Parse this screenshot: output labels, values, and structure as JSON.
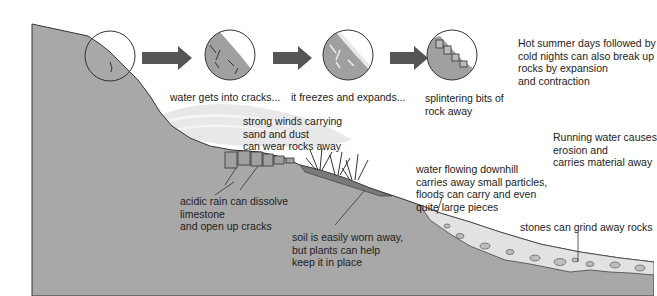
{
  "diagram": {
    "colors": {
      "rock": "#a9a9a9",
      "rock_dark": "#8a8a8a",
      "outline": "#333333",
      "arrow": "#555555",
      "wind": "#e6e6e6",
      "water": "#dcdcdc",
      "text": "#222222"
    },
    "freeze_thaw_steps": [
      {
        "caption": "water gets into cracks...",
        "icon": "cracked-rock-circle"
      },
      {
        "caption": "it freezes and expands...",
        "icon": "ice-filled-crack-circle"
      },
      {
        "caption": "splintering bits of\nrock away",
        "icon": "splintered-rock-circle"
      }
    ],
    "labels": {
      "temperature": "Hot summer days followed by\ncold nights can also break up\nrocks by expansion\nand contraction",
      "wind": "strong winds carrying\nsand and dust\ncan wear rocks away",
      "acid_rain": "acidic rain can dissolve\nlimestone\nand open up cracks",
      "soil": "soil is easily worn away,\nbut plants can help\nkeep it in place",
      "running_water": "Running water causes\nerosion and\ncarries material away",
      "water_flow": "water flowing downhill\ncarries away small particles,\nfloods can carry and even\nquite large pieces",
      "stones": "stones can grind away rocks"
    }
  }
}
